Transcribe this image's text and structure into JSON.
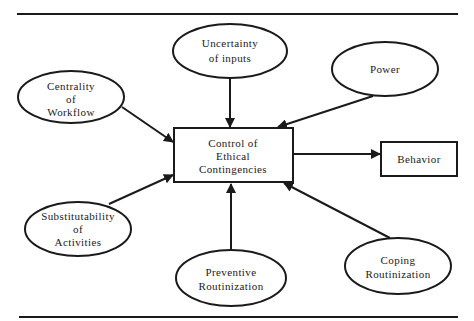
{
  "diagram": {
    "nodes": {
      "uncertainty": {
        "lines": [
          "Uncertainty",
          "of inputs"
        ],
        "shape": "ellipse"
      },
      "power": {
        "lines": [
          "Power"
        ],
        "shape": "ellipse"
      },
      "centrality": {
        "lines": [
          "Centrality",
          "of",
          "Workflow"
        ],
        "shape": "ellipse"
      },
      "control": {
        "lines": [
          "Control of",
          "Ethical",
          "Contingencies"
        ],
        "shape": "rectangle"
      },
      "behavior": {
        "lines": [
          "Behavior"
        ],
        "shape": "rectangle"
      },
      "substitutability": {
        "lines": [
          "Substitutability",
          "of",
          "Activities"
        ],
        "shape": "ellipse"
      },
      "preventive": {
        "lines": [
          "Preventive",
          "Routinization"
        ],
        "shape": "ellipse"
      },
      "coping": {
        "lines": [
          "Coping",
          "Routinization"
        ],
        "shape": "ellipse"
      }
    },
    "edges": [
      {
        "from": "uncertainty",
        "to": "control"
      },
      {
        "from": "power",
        "to": "control"
      },
      {
        "from": "centrality",
        "to": "control"
      },
      {
        "from": "substitutability",
        "to": "control"
      },
      {
        "from": "preventive",
        "to": "control"
      },
      {
        "from": "coping",
        "to": "control"
      },
      {
        "from": "control",
        "to": "behavior"
      }
    ],
    "colors": {
      "stroke": "#1a1a1a",
      "background": "#ffffff"
    }
  }
}
